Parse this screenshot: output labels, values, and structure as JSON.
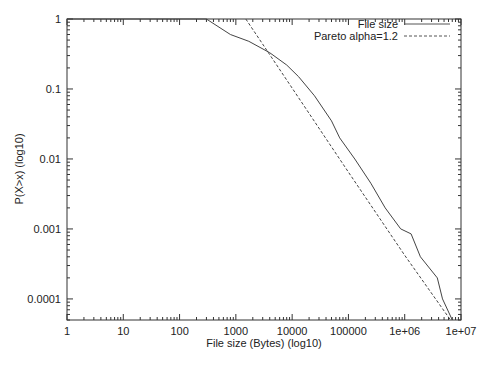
{
  "chart_data": {
    "type": "line",
    "title": "",
    "xlabel": "File size (Bytes) (log10)",
    "ylabel": "P(X>x) (log10)",
    "xscale": "log10",
    "yscale": "log10",
    "xlim": [
      1,
      10000000
    ],
    "ylim": [
      5e-05,
      1
    ],
    "x_ticks": [
      "1",
      "10",
      "100",
      "1000",
      "10000",
      "100000",
      "1e+06",
      "1e+07"
    ],
    "y_ticks": [
      "1",
      "0.1",
      "0.01",
      "0.001",
      "0.0001"
    ],
    "grid": false,
    "legend_position": "top-right",
    "series": [
      {
        "name": "File size",
        "style": "solid",
        "points": [
          [
            1,
            1
          ],
          [
            300,
            1
          ],
          [
            800,
            0.6
          ],
          [
            1700,
            0.48
          ],
          [
            4000,
            0.33
          ],
          [
            8000,
            0.22
          ],
          [
            13000,
            0.15
          ],
          [
            25000,
            0.08
          ],
          [
            50000,
            0.035
          ],
          [
            70000,
            0.02
          ],
          [
            130000,
            0.01
          ],
          [
            250000,
            0.0045
          ],
          [
            450000,
            0.002
          ],
          [
            850000,
            0.001
          ],
          [
            1300000,
            0.00085
          ],
          [
            1900000,
            0.0004
          ],
          [
            3800000,
            0.0002
          ],
          [
            4700000,
            0.0001
          ],
          [
            7000000,
            5e-05
          ]
        ]
      },
      {
        "name": "Pareto alpha=1.2",
        "style": "dashed",
        "points": [
          [
            1500,
            1
          ],
          [
            4000,
            0.31
          ],
          [
            100000,
            0.0065
          ],
          [
            1000000,
            0.00042
          ],
          [
            6500000,
            5e-05
          ]
        ]
      }
    ]
  }
}
